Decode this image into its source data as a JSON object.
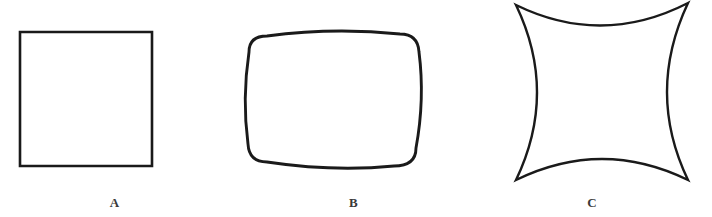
{
  "page": {
    "background_color": "#ffffff",
    "width": 712,
    "height": 217
  },
  "style": {
    "stroke_color": "#1a1a1a",
    "label_color": "#3a3a3a",
    "fill_color": "none",
    "stroke_width": 2.6
  },
  "figures": [
    {
      "id": "figure-a",
      "label": "A",
      "shape_name": "square",
      "description": "plain square with straight sides",
      "side_curvature": 0,
      "corner_style": "sharp-right-angle",
      "bounds": {
        "x": 20,
        "y": 32,
        "width": 132,
        "height": 134
      }
    },
    {
      "id": "figure-b",
      "label": "B",
      "shape_name": "barrel-square",
      "description": "square with outward bulging convex sides and rounded corners",
      "side_curvature": 10,
      "corner_style": "rounded",
      "bounds": {
        "x": 247,
        "y": 30,
        "width": 173,
        "height": 138
      }
    },
    {
      "id": "figure-c",
      "label": "C",
      "shape_name": "astroid-square",
      "description": "square with inward curving concave sides and sharp pointed corners",
      "side_curvature": -21,
      "corner_style": "sharp-cusp",
      "bounds": {
        "x": 516,
        "y": 5,
        "width": 172,
        "height": 175
      }
    }
  ]
}
